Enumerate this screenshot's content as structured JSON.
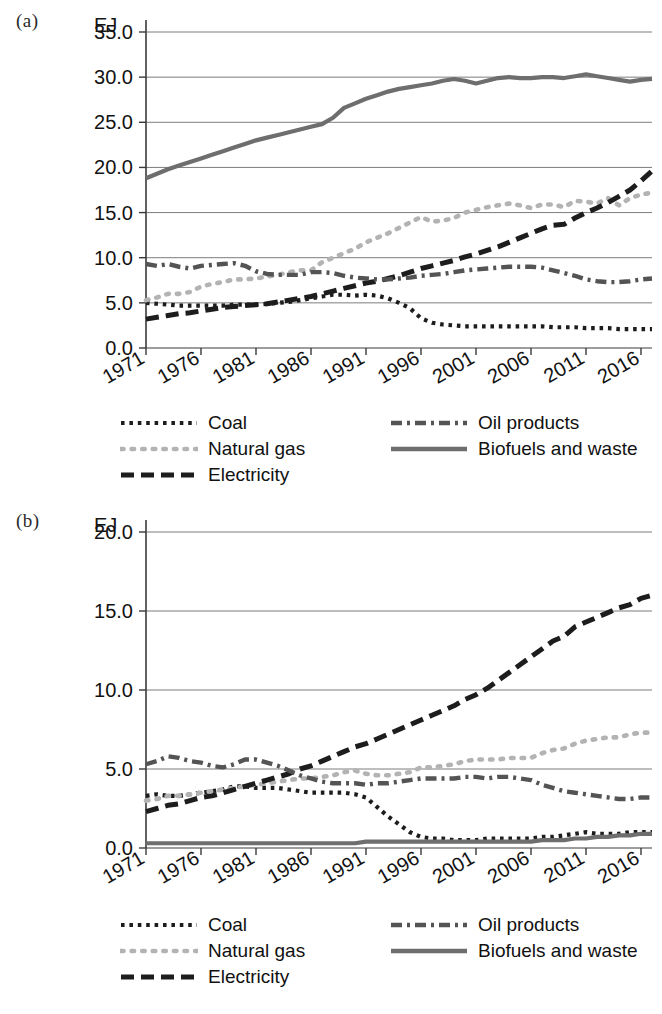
{
  "figure": {
    "panels": [
      {
        "letter": "(a)",
        "unit": "EJ"
      },
      {
        "letter": "(b)",
        "unit": "EJ"
      }
    ],
    "legend": [
      {
        "label": "Coal",
        "key": "coal-dotted-key",
        "color": "#1d1d1d",
        "style": "dotted"
      },
      {
        "label": "Natural gas",
        "key": "natural-gas-dotted-key",
        "color": "#b3b3b3",
        "style": "dotted-light"
      },
      {
        "label": "Electricity",
        "key": "electricity-dashed-key",
        "color": "#1d1d1d",
        "style": "dashed"
      },
      {
        "label": "Oil products",
        "key": "oil-products-dashdot-key",
        "color": "#545454",
        "style": "dash-dot"
      },
      {
        "label": "Biofuels and waste",
        "key": "biofuels-solid-key",
        "color": "#6e6e6e",
        "style": "solid"
      }
    ]
  },
  "chart_data": [
    {
      "type": "line",
      "panel": "(a)",
      "title": "",
      "xlabel": "",
      "ylabel": "EJ",
      "grid": true,
      "legend_position": "below",
      "xlim": [
        1971,
        2017
      ],
      "ylim": [
        0.0,
        35.0
      ],
      "yticks": [
        "0.0",
        "5.0",
        "10.0",
        "15.0",
        "20.0",
        "25.0",
        "30.0",
        "35.0"
      ],
      "xticks": [
        "1971",
        "1976",
        "1981",
        "1986",
        "1991",
        "1996",
        "2001",
        "2006",
        "2011",
        "2016"
      ],
      "x": [
        1971,
        1972,
        1973,
        1974,
        1975,
        1976,
        1977,
        1978,
        1979,
        1980,
        1981,
        1982,
        1983,
        1984,
        1985,
        1986,
        1987,
        1988,
        1989,
        1990,
        1991,
        1992,
        1993,
        1994,
        1995,
        1996,
        1997,
        1998,
        1999,
        2000,
        2001,
        2002,
        2003,
        2004,
        2005,
        2006,
        2007,
        2008,
        2009,
        2010,
        2011,
        2012,
        2013,
        2014,
        2015,
        2016,
        2017
      ],
      "series": [
        {
          "name": "Coal",
          "color": "#1d1d1d",
          "style": "dotted",
          "values": [
            5.0,
            4.9,
            4.8,
            4.7,
            4.7,
            4.7,
            4.7,
            4.7,
            4.8,
            4.8,
            4.8,
            4.9,
            5.0,
            5.1,
            5.3,
            5.5,
            5.7,
            5.9,
            5.9,
            5.8,
            5.9,
            5.8,
            5.5,
            5.0,
            4.4,
            3.3,
            2.8,
            2.6,
            2.5,
            2.4,
            2.4,
            2.4,
            2.4,
            2.4,
            2.4,
            2.4,
            2.4,
            2.3,
            2.3,
            2.3,
            2.2,
            2.2,
            2.2,
            2.1,
            2.1,
            2.1,
            2.1
          ]
        },
        {
          "name": "Natural gas",
          "color": "#b3b3b3",
          "style": "dotted-light",
          "values": [
            5.3,
            5.6,
            6.0,
            6.0,
            6.2,
            6.8,
            7.1,
            7.3,
            7.6,
            7.6,
            7.7,
            7.9,
            8.1,
            8.4,
            8.6,
            8.6,
            9.5,
            10.0,
            10.5,
            11.0,
            11.7,
            12.2,
            12.7,
            13.3,
            13.9,
            14.5,
            14.0,
            14.1,
            14.4,
            15.0,
            15.3,
            15.6,
            15.8,
            16.0,
            15.8,
            15.5,
            15.9,
            15.9,
            15.6,
            16.3,
            16.2,
            16.0,
            16.6,
            15.8,
            16.6,
            17.0,
            17.2
          ]
        },
        {
          "name": "Electricity",
          "color": "#1d1d1d",
          "style": "dashed",
          "values": [
            3.2,
            3.4,
            3.6,
            3.8,
            3.9,
            4.1,
            4.3,
            4.5,
            4.6,
            4.7,
            4.8,
            4.9,
            5.1,
            5.3,
            5.5,
            5.7,
            6.0,
            6.3,
            6.6,
            6.9,
            7.2,
            7.4,
            7.7,
            8.0,
            8.4,
            8.8,
            9.1,
            9.4,
            9.7,
            10.1,
            10.4,
            10.8,
            11.2,
            11.7,
            12.2,
            12.7,
            13.2,
            13.6,
            13.7,
            14.4,
            15.0,
            15.5,
            16.1,
            16.8,
            17.5,
            18.5,
            19.6
          ]
        },
        {
          "name": "Oil products",
          "color": "#545454",
          "style": "dash-dot",
          "values": [
            9.3,
            9.1,
            9.3,
            9.0,
            8.8,
            9.1,
            9.2,
            9.3,
            9.4,
            9.1,
            8.5,
            8.2,
            8.1,
            8.1,
            8.1,
            8.4,
            8.4,
            8.3,
            8.0,
            7.8,
            7.7,
            7.6,
            7.6,
            7.7,
            7.8,
            8.0,
            8.1,
            8.2,
            8.4,
            8.6,
            8.7,
            8.8,
            8.9,
            9.0,
            9.0,
            9.0,
            8.9,
            8.6,
            8.3,
            8.0,
            7.6,
            7.4,
            7.3,
            7.3,
            7.4,
            7.6,
            7.7
          ]
        },
        {
          "name": "Biofuels and waste",
          "color": "#6e6e6e",
          "style": "solid",
          "values": [
            18.8,
            19.3,
            19.8,
            20.2,
            20.6,
            21.0,
            21.4,
            21.8,
            22.2,
            22.6,
            23.0,
            23.3,
            23.6,
            23.9,
            24.2,
            24.5,
            24.8,
            25.5,
            26.6,
            27.1,
            27.6,
            28.0,
            28.4,
            28.7,
            28.9,
            29.1,
            29.3,
            29.6,
            29.8,
            29.6,
            29.3,
            29.6,
            29.9,
            30.0,
            29.9,
            29.9,
            30.0,
            30.0,
            29.9,
            30.1,
            30.3,
            30.1,
            29.9,
            29.7,
            29.5,
            29.7,
            29.8
          ]
        }
      ]
    },
    {
      "type": "line",
      "panel": "(b)",
      "title": "",
      "xlabel": "",
      "ylabel": "EJ",
      "grid": true,
      "legend_position": "below",
      "xlim": [
        1971,
        2017
      ],
      "ylim": [
        0.0,
        20.0
      ],
      "yticks": [
        "0.0",
        "5.0",
        "10.0",
        "15.0",
        "20.0"
      ],
      "xticks": [
        "1971",
        "1976",
        "1981",
        "1986",
        "1991",
        "1996",
        "2001",
        "2006",
        "2011",
        "2016"
      ],
      "x": [
        1971,
        1972,
        1973,
        1974,
        1975,
        1976,
        1977,
        1978,
        1979,
        1980,
        1981,
        1982,
        1983,
        1984,
        1985,
        1986,
        1987,
        1988,
        1989,
        1990,
        1991,
        1992,
        1993,
        1994,
        1995,
        1996,
        1997,
        1998,
        1999,
        2000,
        2001,
        2002,
        2003,
        2004,
        2005,
        2006,
        2007,
        2008,
        2009,
        2010,
        2011,
        2012,
        2013,
        2014,
        2015,
        2016,
        2017
      ],
      "series": [
        {
          "name": "Coal",
          "color": "#1d1d1d",
          "style": "dotted",
          "values": [
            3.3,
            3.4,
            3.3,
            3.3,
            3.4,
            3.5,
            3.6,
            3.7,
            3.9,
            3.9,
            3.8,
            3.8,
            3.8,
            3.7,
            3.6,
            3.5,
            3.5,
            3.5,
            3.5,
            3.4,
            3.2,
            2.6,
            2.0,
            1.5,
            1.0,
            0.7,
            0.6,
            0.6,
            0.5,
            0.5,
            0.5,
            0.6,
            0.6,
            0.6,
            0.6,
            0.6,
            0.7,
            0.7,
            0.8,
            0.9,
            1.0,
            0.9,
            0.9,
            0.9,
            1.0,
            1.0,
            1.0
          ]
        },
        {
          "name": "Natural gas",
          "color": "#b3b3b3",
          "style": "dotted-light",
          "values": [
            3.0,
            3.1,
            3.3,
            3.3,
            3.4,
            3.5,
            3.6,
            3.7,
            3.8,
            3.9,
            4.0,
            4.1,
            4.2,
            4.3,
            4.4,
            4.4,
            4.5,
            4.6,
            4.8,
            4.9,
            4.7,
            4.6,
            4.6,
            4.7,
            4.8,
            5.1,
            5.1,
            5.2,
            5.3,
            5.5,
            5.6,
            5.6,
            5.6,
            5.7,
            5.7,
            5.7,
            6.0,
            6.2,
            6.3,
            6.6,
            6.8,
            6.9,
            7.0,
            7.0,
            7.2,
            7.3,
            7.3
          ]
        },
        {
          "name": "Electricity",
          "color": "#1d1d1d",
          "style": "dashed",
          "values": [
            2.3,
            2.5,
            2.7,
            2.8,
            3.0,
            3.2,
            3.3,
            3.5,
            3.7,
            3.9,
            4.1,
            4.3,
            4.5,
            4.7,
            5.0,
            5.2,
            5.5,
            5.8,
            6.1,
            6.4,
            6.6,
            6.9,
            7.2,
            7.5,
            7.8,
            8.1,
            8.4,
            8.7,
            9.0,
            9.4,
            9.7,
            10.1,
            10.6,
            11.1,
            11.6,
            12.1,
            12.6,
            13.1,
            13.4,
            14.0,
            14.3,
            14.6,
            14.9,
            15.2,
            15.4,
            15.8,
            16.0
          ]
        },
        {
          "name": "Oil products",
          "color": "#545454",
          "style": "dash-dot",
          "values": [
            5.3,
            5.5,
            5.8,
            5.7,
            5.5,
            5.4,
            5.2,
            5.1,
            5.3,
            5.6,
            5.6,
            5.4,
            5.2,
            4.9,
            4.6,
            4.4,
            4.2,
            4.1,
            4.1,
            4.1,
            4.0,
            4.1,
            4.1,
            4.2,
            4.3,
            4.4,
            4.4,
            4.4,
            4.4,
            4.5,
            4.5,
            4.4,
            4.5,
            4.5,
            4.4,
            4.3,
            4.0,
            3.8,
            3.6,
            3.5,
            3.4,
            3.3,
            3.2,
            3.1,
            3.1,
            3.2,
            3.2
          ]
        },
        {
          "name": "Biofuels and waste",
          "color": "#6e6e6e",
          "style": "solid",
          "values": [
            0.3,
            0.3,
            0.3,
            0.3,
            0.3,
            0.3,
            0.3,
            0.3,
            0.3,
            0.3,
            0.3,
            0.3,
            0.3,
            0.3,
            0.3,
            0.3,
            0.3,
            0.3,
            0.3,
            0.3,
            0.4,
            0.4,
            0.4,
            0.4,
            0.4,
            0.4,
            0.4,
            0.4,
            0.4,
            0.4,
            0.4,
            0.4,
            0.4,
            0.4,
            0.4,
            0.4,
            0.5,
            0.5,
            0.5,
            0.6,
            0.6,
            0.7,
            0.7,
            0.8,
            0.8,
            0.9,
            0.9
          ]
        }
      ]
    }
  ]
}
